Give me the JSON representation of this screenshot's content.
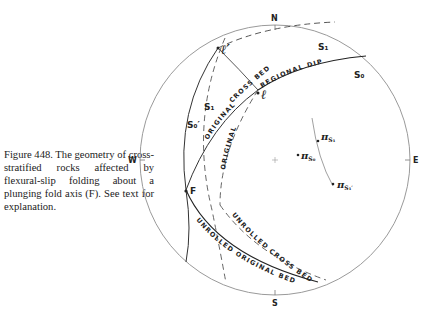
{
  "caption": {
    "text": "Figure 448. The geometry of cross-stratified rocks affected by flexural-slip folding about a plunging fold axis (F). See text for explanation."
  },
  "stereonet": {
    "cardinals": {
      "north": "N",
      "south": "S",
      "east": "E",
      "west": "W"
    },
    "curve_labels": {
      "cross_bed": "CROSS    BED",
      "regional_dip": "REGIONAL   DIP",
      "original_outer": "ORIGINAL",
      "original_inner": "ORIGINAL",
      "unrolled_cross_bed": "UNROLLED   CROSS   BED",
      "unrolled_original_bed": "UNROLLED   ORIGINAL   BED"
    },
    "plane_labels": {
      "s1_top": "S₁",
      "s0_right": "S₀",
      "s1_left": "S₁",
      "s0_prime": "S₀′"
    },
    "point_labels": {
      "l_prime": "ℓ′",
      "l": "ℓ",
      "fold_axis": "F",
      "pi_s1": "π",
      "pi_s1_sub": "S₁",
      "pi_s0": "π",
      "pi_s0_sub": "S₀",
      "pi_s1_prime": "π",
      "pi_s1_prime_sub": "S₁′"
    },
    "colors": {
      "ink": "#222222",
      "primitive": "#9a9a9a"
    }
  }
}
